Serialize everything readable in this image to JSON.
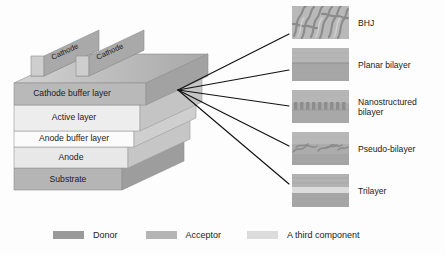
{
  "device": {
    "name": "device-stack",
    "electrodes": [
      {
        "label": "Cathode"
      },
      {
        "label": "Cathode"
      }
    ],
    "layers": [
      {
        "id": "cathode-buffer-layer",
        "label": "Cathode buffer layer",
        "color": "#b9b9b9"
      },
      {
        "id": "active-layer",
        "label": "Active layer",
        "color": "#ededed"
      },
      {
        "id": "anode-buffer-layer",
        "label": "Anode buffer layer",
        "color": "#fbfbfb"
      },
      {
        "id": "anode",
        "label": "Anode",
        "color": "#e8e8e8"
      },
      {
        "id": "substrate",
        "label": "Substrate",
        "color": "#b5b5b5"
      }
    ]
  },
  "connectors": {
    "name": "fan-lines",
    "count": 5,
    "origin": {
      "x": 178,
      "y": 90
    },
    "color": "#111111"
  },
  "morphologies": [
    {
      "id": "bhj",
      "label": "BHJ",
      "texture": "interpenetrating-network"
    },
    {
      "id": "planar-bilayer",
      "label": "Planar bilayer",
      "texture": "two-flat-bands"
    },
    {
      "id": "nanostructured-bilayer",
      "label": "Nanostructured\nbilayer",
      "texture": "comb-pillars"
    },
    {
      "id": "pseudo-bilayer",
      "label": "Pseudo-bilayer",
      "texture": "diffuse-interface"
    },
    {
      "id": "trilayer",
      "label": "Trilayer",
      "texture": "three-bands"
    }
  ],
  "legend": {
    "items": [
      {
        "id": "donor",
        "label": "Donor",
        "color": "#9a9a9a"
      },
      {
        "id": "acceptor",
        "label": "Acceptor",
        "color": "#b4b4b4"
      },
      {
        "id": "third-component",
        "label": "A third component",
        "color": "#dcdcdc"
      }
    ]
  }
}
